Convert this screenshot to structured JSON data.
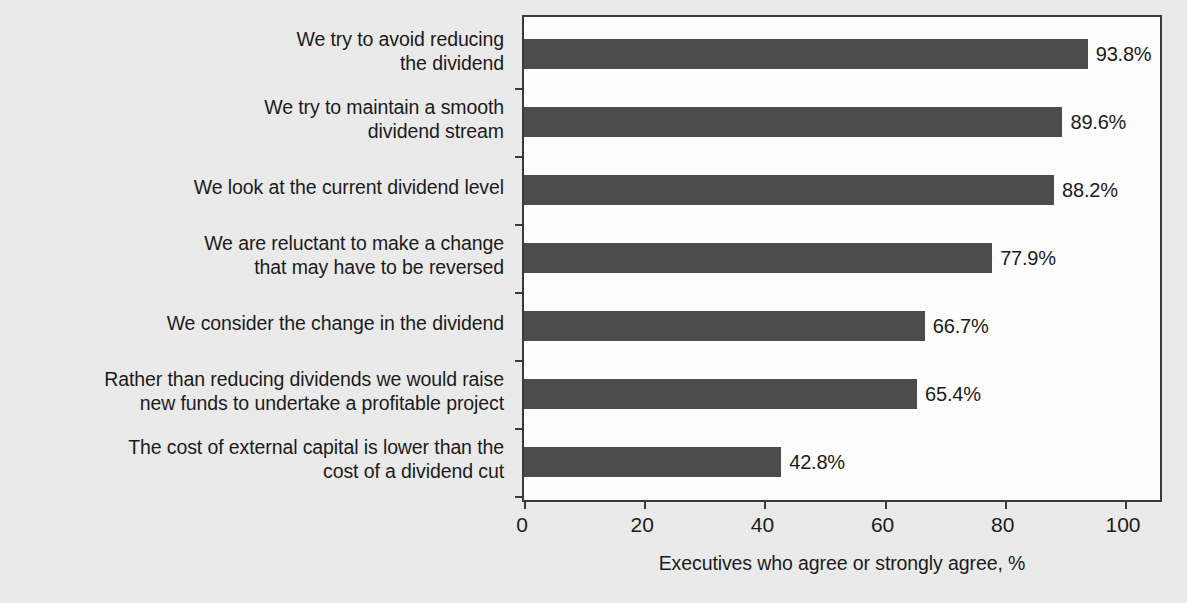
{
  "chart_data": {
    "type": "bar",
    "orientation": "horizontal",
    "title": "",
    "subtitle": "",
    "xlabel": "Executives who agree or strongly agree, %",
    "ylabel": "",
    "xlim": [
      0,
      100
    ],
    "xticks": [
      0,
      20,
      40,
      60,
      80,
      100
    ],
    "xtick_labels": [
      "0",
      "20",
      "40",
      "60",
      "80",
      "100"
    ],
    "grid": false,
    "legend": null,
    "bar_color": "#4c4c4c",
    "plot_background": "#fdfdfd",
    "page_background": "#ebeaea",
    "categories": [
      "We try to avoid reducing the dividend",
      "We try to maintain a smooth dividend stream",
      "We look at the current dividend level",
      "We are reluctant to make a change that may have to be reversed",
      "We consider the change in the dividend",
      "Rather than reducing dividends we would raise new funds to undertake a profitable project",
      "The cost of external capital is lower than the cost of a dividend cut"
    ],
    "category_lines": [
      [
        "We try to avoid reducing",
        "the dividend"
      ],
      [
        "We try to maintain a smooth",
        "dividend stream"
      ],
      [
        "We look at the current dividend level"
      ],
      [
        "We are reluctant to make a change",
        "that may have to be reversed"
      ],
      [
        "We consider the change in the dividend"
      ],
      [
        "Rather than reducing dividends we would raise",
        "new funds to undertake a profitable project"
      ],
      [
        "The cost of external capital is lower than the",
        "cost of a dividend cut"
      ]
    ],
    "values": [
      93.8,
      89.6,
      88.2,
      77.9,
      66.7,
      65.4,
      42.8
    ],
    "value_labels": [
      "93.8%",
      "89.6%",
      "88.2%",
      "77.9%",
      "66.7%",
      "65.4%",
      "42.8%"
    ]
  }
}
